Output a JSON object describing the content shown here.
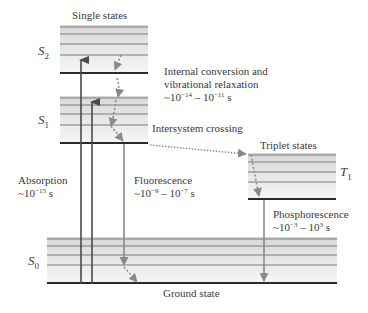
{
  "diagram": {
    "headers": {
      "singlet": "Single states",
      "triplet": "Triplet states",
      "ground": "Ground state"
    },
    "states": {
      "S2": {
        "base": "S",
        "sub": "2"
      },
      "S1": {
        "base": "S",
        "sub": "1"
      },
      "S0": {
        "base": "S",
        "sub": "0"
      },
      "T1": {
        "base": "T",
        "sub": "1"
      }
    },
    "processes": {
      "absorption": {
        "name": "Absorption",
        "time_prefix": "~10",
        "time_exp": "−15",
        "time_suffix": " s"
      },
      "internal_conversion": {
        "line1": "Internal conversion and",
        "line2": "vibrational relaxation",
        "t1": "~10",
        "e1": "−14",
        "mid": " – 10",
        "e2": "−11",
        "suffix": " s"
      },
      "intersystem_crossing": {
        "name": "Intersystem crossing"
      },
      "fluorescence": {
        "name": "Fluorescence",
        "t1": "~10",
        "e1": "−9",
        "mid": " – 10",
        "e2": "−7",
        "suffix": " s"
      },
      "phosphorescence": {
        "name": "Phosphorescence",
        "t1": "~10",
        "e1": "−3",
        "mid": " – 10",
        "e2": "3",
        "suffix": " s"
      }
    },
    "colors": {
      "ground_line": "#2b2b2b",
      "vib_line": "#7a7a7a",
      "absorption_arrow": "#4a4a4a",
      "emission_arrow": "#8a8a8a",
      "dotted": "#8a8a8a",
      "band_fill": "#e6e6e6"
    }
  }
}
